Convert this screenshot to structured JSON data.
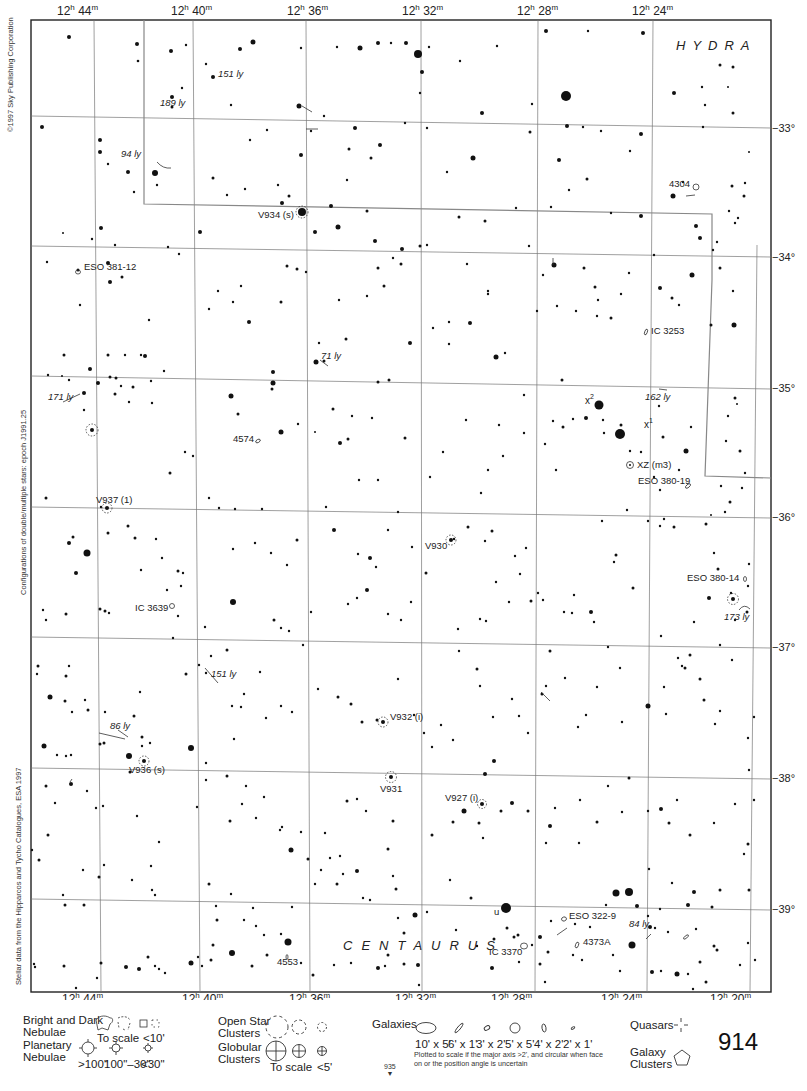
{
  "chart_data": {
    "type": "star-atlas-chart",
    "page_number": "914",
    "adjacent_page": "935",
    "constellations": [
      "HYDRA",
      "CENTAURUS"
    ],
    "ra_ticks_top": [
      "12h 44m",
      "12h 40m",
      "12h 36m",
      "12h 32m",
      "12h 28m",
      "12h 24m"
    ],
    "ra_ticks_bottom": [
      "12h 44m",
      "12h 40m",
      "12h 36m",
      "12h 32m",
      "12h 28m",
      "12h 24m",
      "12h 20m"
    ],
    "dec_ticks": [
      "-33°",
      "-34°",
      "-35°",
      "-36°",
      "-37°",
      "-38°",
      "-39°"
    ],
    "labels": [
      {
        "text": "151 ly",
        "x": 218,
        "y": 77,
        "italic": true
      },
      {
        "text": "189 ly",
        "x": 160,
        "y": 106,
        "italic": true
      },
      {
        "text": "94 ly",
        "x": 121,
        "y": 157,
        "italic": true
      },
      {
        "text": "V934 (s)",
        "x": 258,
        "y": 218,
        "italic": false
      },
      {
        "text": "ESO 381-12",
        "x": 84,
        "y": 270,
        "italic": false
      },
      {
        "text": "4304",
        "x": 669,
        "y": 187,
        "italic": false
      },
      {
        "text": "IC 3253",
        "x": 651,
        "y": 334,
        "italic": false
      },
      {
        "text": "71 ly",
        "x": 321,
        "y": 359,
        "italic": true
      },
      {
        "text": "171 ly",
        "x": 48,
        "y": 400,
        "italic": true
      },
      {
        "text": "162 ly",
        "x": 645,
        "y": 400,
        "italic": true
      },
      {
        "text": "x²",
        "x": 585,
        "y": 404,
        "italic": false
      },
      {
        "text": "x¹",
        "x": 644,
        "y": 428,
        "italic": false
      },
      {
        "text": "4574",
        "x": 233,
        "y": 442,
        "italic": false
      },
      {
        "text": "XZ (m3)",
        "x": 637,
        "y": 468,
        "italic": false
      },
      {
        "text": "ESO 380-19",
        "x": 638,
        "y": 484,
        "italic": false
      },
      {
        "text": "V937 (1)",
        "x": 96,
        "y": 503,
        "italic": false
      },
      {
        "text": "V930",
        "x": 425,
        "y": 549,
        "italic": false
      },
      {
        "text": "ESO 380-14",
        "x": 687,
        "y": 581,
        "italic": false
      },
      {
        "text": "IC 3639",
        "x": 135,
        "y": 611,
        "italic": false
      },
      {
        "text": "173 ly",
        "x": 724,
        "y": 620,
        "italic": true
      },
      {
        "text": "151 ly",
        "x": 211,
        "y": 677,
        "italic": true
      },
      {
        "text": "V932 (i)",
        "x": 390,
        "y": 720,
        "italic": false
      },
      {
        "text": "86 ly",
        "x": 110,
        "y": 729,
        "italic": true
      },
      {
        "text": "V936 (s)",
        "x": 129,
        "y": 773,
        "italic": false
      },
      {
        "text": "V931",
        "x": 380,
        "y": 792,
        "italic": false
      },
      {
        "text": "V927 (i)",
        "x": 445,
        "y": 801,
        "italic": false
      },
      {
        "text": "u",
        "x": 494,
        "y": 915,
        "italic": false
      },
      {
        "text": "ESO 322-9",
        "x": 569,
        "y": 919,
        "italic": false
      },
      {
        "text": "84 ly",
        "x": 629,
        "y": 927,
        "italic": true
      },
      {
        "text": "4373A",
        "x": 583,
        "y": 945,
        "italic": false
      },
      {
        "text": "IC 3370",
        "x": 489,
        "y": 955,
        "italic": false
      },
      {
        "text": "4553",
        "x": 277,
        "y": 965,
        "italic": false
      }
    ],
    "notes": {
      "copyright": "©1997 Sky Publishing Corporation",
      "epoch": "Configurations of double/multiple stars: epoch J1991.25",
      "source": "Stellar data from the Hipparcos and Tycho Catalogues, ESA 1997"
    }
  },
  "legend": {
    "bright_dark_nebulae": "Bright and Dark\nNebulae",
    "bn_to_scale": "To scale",
    "bn_small": "<10'",
    "planetary_nebulae": "Planetary\nNebulae",
    "pn_sizes": [
      ">100\"",
      "100\"–30\"",
      "<30\""
    ],
    "open_star_clusters": "Open Star\nClusters",
    "globular_clusters": "Globular\nClusters",
    "gc_to_scale": "To scale",
    "gc_small": "<5'",
    "galaxies": "Galaxies",
    "galaxy_sizes": [
      "10' x 5'",
      "6' x 1'",
      "3' x 2'",
      "5' x 5'",
      "4' x 2'",
      "2' x 1'"
    ],
    "galaxy_note": "Plotted to scale if the major axis >2', and circular when face on or the position angle is uncertain",
    "quasars": "Quasars",
    "galaxy_clusters": "Galaxy\nClusters"
  }
}
